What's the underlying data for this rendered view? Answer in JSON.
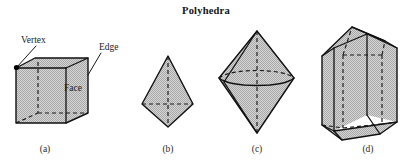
{
  "figure": {
    "title": "Polyhedra",
    "fill_color": "#c9c9c9",
    "stroke_color": "#111111",
    "background_color": "#ffffff",
    "panels": [
      {
        "id": "a",
        "caption": "(a)",
        "shape_name": "cube",
        "annotations": [
          {
            "name": "vertex",
            "label": "Vertex"
          },
          {
            "name": "edge",
            "label": "Edge"
          },
          {
            "name": "face",
            "label": "Face"
          }
        ]
      },
      {
        "id": "b",
        "caption": "(b)",
        "shape_name": "tall-bipyramid",
        "annotations": []
      },
      {
        "id": "c",
        "caption": "(c)",
        "shape_name": "hexagonal-bipyramid",
        "annotations": []
      },
      {
        "id": "d",
        "caption": "(d)",
        "shape_name": "pentagonal-prism",
        "annotations": []
      }
    ]
  }
}
